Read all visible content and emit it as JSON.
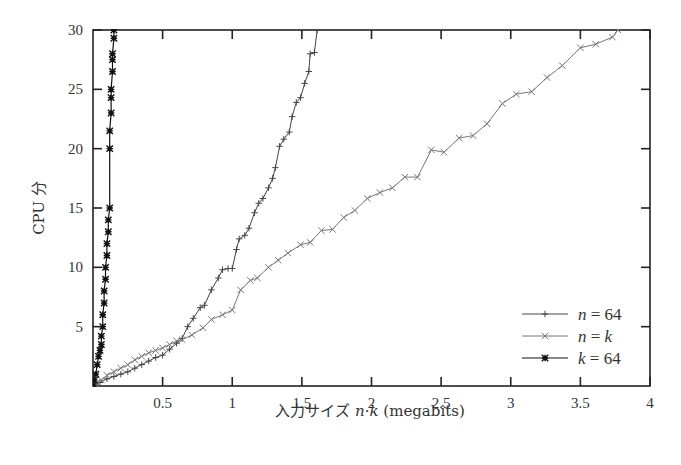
{
  "chart_data": {
    "type": "line",
    "title": "",
    "xlabel": "入力サイズ n·k (megabits)",
    "xlabel_parts": {
      "prefix": "入力サイズ ",
      "var": "n·k",
      "suffix": " (megabits)"
    },
    "ylabel": "CPU 分",
    "xlim": [
      0,
      4
    ],
    "ylim": [
      0,
      30
    ],
    "xticks": [
      0.5,
      1,
      1.5,
      2,
      2.5,
      3,
      3.5,
      4
    ],
    "xtick_labels": [
      "0.5",
      "1",
      "1.5",
      "2",
      "2.5",
      "3",
      "3.5",
      "4"
    ],
    "yticks": [
      5,
      10,
      15,
      20,
      25,
      30
    ],
    "ytick_labels": [
      "5",
      "10",
      "15",
      "20",
      "25",
      "30"
    ],
    "grid": false,
    "legend_position": "lower right",
    "series": [
      {
        "name": "n = 64",
        "legend_var": "n",
        "legend_value": "= 64",
        "marker": "plus",
        "color": "#444444",
        "points": [
          [
            0.02,
            0.1
          ],
          [
            0.05,
            0.3
          ],
          [
            0.1,
            0.6
          ],
          [
            0.15,
            0.8
          ],
          [
            0.2,
            1.0
          ],
          [
            0.25,
            1.2
          ],
          [
            0.3,
            1.5
          ],
          [
            0.35,
            1.8
          ],
          [
            0.4,
            2.1
          ],
          [
            0.45,
            2.4
          ],
          [
            0.5,
            2.6
          ],
          [
            0.55,
            3.1
          ],
          [
            0.6,
            3.6
          ],
          [
            0.64,
            4.0
          ],
          [
            0.68,
            5.0
          ],
          [
            0.72,
            5.7
          ],
          [
            0.77,
            6.6
          ],
          [
            0.8,
            6.8
          ],
          [
            0.85,
            8.1
          ],
          [
            0.9,
            9.1
          ],
          [
            0.93,
            9.8
          ],
          [
            0.97,
            9.9
          ],
          [
            1.0,
            9.9
          ],
          [
            1.03,
            11.5
          ],
          [
            1.05,
            12.4
          ],
          [
            1.09,
            12.7
          ],
          [
            1.12,
            13.3
          ],
          [
            1.16,
            14.6
          ],
          [
            1.19,
            15.4
          ],
          [
            1.22,
            15.8
          ],
          [
            1.26,
            16.7
          ],
          [
            1.29,
            17.5
          ],
          [
            1.31,
            18.4
          ],
          [
            1.34,
            20.2
          ],
          [
            1.37,
            20.8
          ],
          [
            1.41,
            21.4
          ],
          [
            1.43,
            22.7
          ],
          [
            1.46,
            23.9
          ],
          [
            1.49,
            24.3
          ],
          [
            1.52,
            25.5
          ],
          [
            1.55,
            26.5
          ],
          [
            1.56,
            28.0
          ],
          [
            1.59,
            28.1
          ],
          [
            1.61,
            30.0
          ]
        ]
      },
      {
        "name": "n = k",
        "legend_var": "n",
        "legend_value": "= k",
        "marker": "x",
        "color": "#777777",
        "points": [
          [
            0.02,
            0.2
          ],
          [
            0.06,
            0.5
          ],
          [
            0.1,
            0.9
          ],
          [
            0.15,
            1.2
          ],
          [
            0.2,
            1.5
          ],
          [
            0.25,
            1.8
          ],
          [
            0.3,
            2.2
          ],
          [
            0.35,
            2.5
          ],
          [
            0.4,
            2.8
          ],
          [
            0.45,
            3.0
          ],
          [
            0.5,
            3.2
          ],
          [
            0.55,
            3.5
          ],
          [
            0.6,
            3.8
          ],
          [
            0.64,
            3.9
          ],
          [
            0.71,
            4.3
          ],
          [
            0.79,
            4.9
          ],
          [
            0.85,
            5.6
          ],
          [
            0.93,
            6.0
          ],
          [
            1.0,
            6.4
          ],
          [
            1.06,
            8.1
          ],
          [
            1.13,
            8.9
          ],
          [
            1.18,
            9.1
          ],
          [
            1.26,
            10.0
          ],
          [
            1.33,
            10.6
          ],
          [
            1.4,
            11.2
          ],
          [
            1.49,
            11.9
          ],
          [
            1.56,
            12.1
          ],
          [
            1.64,
            13.1
          ],
          [
            1.72,
            13.2
          ],
          [
            1.8,
            14.2
          ],
          [
            1.88,
            14.8
          ],
          [
            1.97,
            15.8
          ],
          [
            2.06,
            16.3
          ],
          [
            2.15,
            16.7
          ],
          [
            2.24,
            17.6
          ],
          [
            2.33,
            17.6
          ],
          [
            2.43,
            19.9
          ],
          [
            2.52,
            19.7
          ],
          [
            2.63,
            20.9
          ],
          [
            2.73,
            21.1
          ],
          [
            2.83,
            22.1
          ],
          [
            2.94,
            23.8
          ],
          [
            3.04,
            24.6
          ],
          [
            3.15,
            24.8
          ],
          [
            3.26,
            26.0
          ],
          [
            3.37,
            27.0
          ],
          [
            3.5,
            28.5
          ],
          [
            3.61,
            28.8
          ],
          [
            3.73,
            29.4
          ],
          [
            3.77,
            30.0
          ]
        ]
      },
      {
        "name": "k = 64",
        "legend_var": "k",
        "legend_value": "= 64",
        "marker": "star",
        "color": "#111111",
        "points": [
          [
            0.0,
            0.0
          ],
          [
            0.01,
            0.5
          ],
          [
            0.02,
            1.0
          ],
          [
            0.03,
            1.8
          ],
          [
            0.04,
            2.5
          ],
          [
            0.05,
            3.0
          ],
          [
            0.06,
            3.5
          ],
          [
            0.06,
            4.2
          ],
          [
            0.07,
            5.0
          ],
          [
            0.07,
            6.0
          ],
          [
            0.08,
            7.0
          ],
          [
            0.08,
            8.0
          ],
          [
            0.09,
            9.0
          ],
          [
            0.09,
            10.0
          ],
          [
            0.1,
            11.0
          ],
          [
            0.1,
            12.0
          ],
          [
            0.11,
            13.0
          ],
          [
            0.11,
            14.0
          ],
          [
            0.12,
            15.0
          ],
          [
            0.12,
            20.0
          ],
          [
            0.12,
            21.5
          ],
          [
            0.13,
            23.0
          ],
          [
            0.13,
            24.3
          ],
          [
            0.13,
            25.0
          ],
          [
            0.14,
            26.5
          ],
          [
            0.14,
            27.5
          ],
          [
            0.14,
            28.0
          ],
          [
            0.15,
            29.3
          ],
          [
            0.15,
            30.0
          ]
        ]
      }
    ]
  }
}
